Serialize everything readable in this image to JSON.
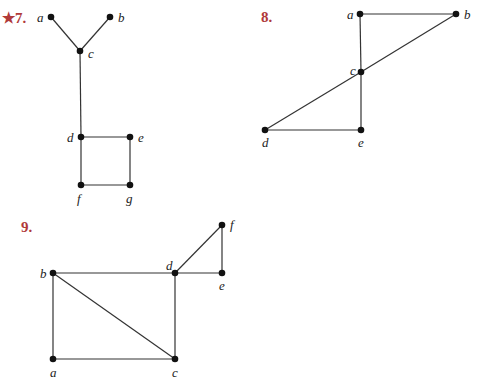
{
  "graphs": [
    {
      "number": "★7.",
      "nodes": [
        {
          "id": "a",
          "x": 51,
          "y": 17,
          "lx": 37,
          "ly": 22
        },
        {
          "id": "b",
          "x": 110,
          "y": 17,
          "lx": 118,
          "ly": 22
        },
        {
          "id": "c",
          "x": 80,
          "y": 51,
          "lx": 88,
          "ly": 58
        },
        {
          "id": "d",
          "x": 81,
          "y": 137,
          "lx": 67,
          "ly": 142
        },
        {
          "id": "e",
          "x": 130,
          "y": 137,
          "lx": 138,
          "ly": 142
        },
        {
          "id": "f",
          "x": 81,
          "y": 185,
          "lx": 77,
          "ly": 203
        },
        {
          "id": "g",
          "x": 130,
          "y": 185,
          "lx": 126,
          "ly": 203
        }
      ],
      "edges": [
        [
          "a",
          "c"
        ],
        [
          "b",
          "c"
        ],
        [
          "c",
          "d"
        ],
        [
          "d",
          "e"
        ],
        [
          "d",
          "f"
        ],
        [
          "e",
          "g"
        ],
        [
          "f",
          "g"
        ]
      ]
    },
    {
      "number": "8.",
      "nodes": [
        {
          "id": "a",
          "x": 360,
          "y": 14,
          "lx": 347,
          "ly": 19
        },
        {
          "id": "b",
          "x": 456,
          "y": 14,
          "lx": 464,
          "ly": 19
        },
        {
          "id": "c",
          "x": 361,
          "y": 72,
          "lx": 350,
          "ly": 75
        },
        {
          "id": "d",
          "x": 265,
          "y": 130,
          "lx": 262,
          "ly": 147
        },
        {
          "id": "e",
          "x": 361,
          "y": 130,
          "lx": 358,
          "ly": 147
        }
      ],
      "edges": [
        [
          "a",
          "b"
        ],
        [
          "a",
          "c"
        ],
        [
          "b",
          "c"
        ],
        [
          "c",
          "d"
        ],
        [
          "c",
          "e"
        ],
        [
          "d",
          "e"
        ]
      ]
    },
    {
      "number": "9.",
      "nodes": [
        {
          "id": "a",
          "x": 53,
          "y": 359,
          "lx": 50,
          "ly": 377
        },
        {
          "id": "b",
          "x": 53,
          "y": 273,
          "lx": 40,
          "ly": 278
        },
        {
          "id": "c",
          "x": 175,
          "y": 359,
          "lx": 172,
          "ly": 377
        },
        {
          "id": "d",
          "x": 175,
          "y": 273,
          "lx": 166,
          "ly": 270
        },
        {
          "id": "e",
          "x": 222,
          "y": 273,
          "lx": 219,
          "ly": 290
        },
        {
          "id": "f",
          "x": 222,
          "y": 225,
          "lx": 230,
          "ly": 229
        }
      ],
      "edges": [
        [
          "a",
          "b"
        ],
        [
          "a",
          "c"
        ],
        [
          "b",
          "c"
        ],
        [
          "b",
          "d"
        ],
        [
          "c",
          "d"
        ],
        [
          "d",
          "e"
        ],
        [
          "d",
          "f"
        ],
        [
          "e",
          "f"
        ]
      ]
    }
  ],
  "labels": {
    "g7": "★7.",
    "g8": "8.",
    "g9": "9."
  }
}
